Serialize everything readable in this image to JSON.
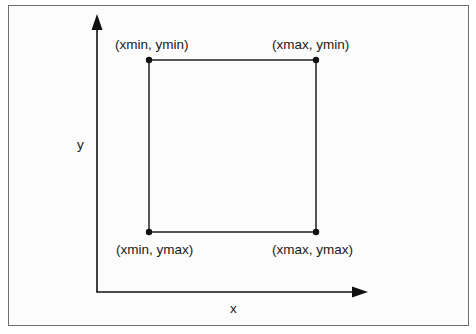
{
  "diagram": {
    "axes": {
      "x_label": "x",
      "y_label": "y"
    },
    "corners": {
      "top_left": "(xmin, ymin)",
      "top_right": "(xmax, ymin)",
      "bottom_left": "(xmin, ymax)",
      "bottom_right": "(xmax, ymax)"
    },
    "colors": {
      "stroke": "#111111",
      "frame": "#6e6e6e",
      "background": "#fcfcfc"
    }
  }
}
